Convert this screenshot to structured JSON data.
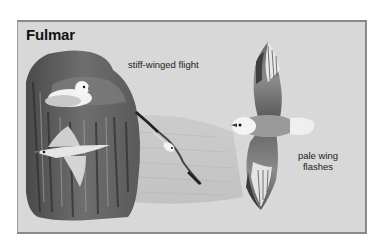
{
  "illustration": {
    "title": "Fulmar",
    "annotations": [
      {
        "id": "flight",
        "text": "stiff-winged flight"
      },
      {
        "id": "flashes",
        "line1": "pale wing",
        "line2": "flashes"
      }
    ],
    "subjects": [
      "fulmar-perched-on-cliff",
      "fulmar-gliding-near-cliff",
      "fulmar-banking-over-sea",
      "fulmar-from-above-wings-spread"
    ],
    "colors": {
      "panel_bg": "#d8d8d8",
      "border": "#8a8a8a",
      "text": "#111111"
    }
  }
}
